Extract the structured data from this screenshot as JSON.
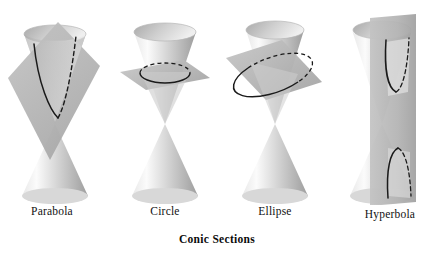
{
  "figure": {
    "title": "Conic Sections",
    "background_color": "#ffffff",
    "panels": [
      {
        "id": "parabola",
        "label": "Parabola",
        "icon": "double-cone-with-tilted-plane-icon",
        "description": "Double cone cut by a plane parallel to a generating line",
        "plane_orientation": "tilted steep",
        "curve": "open upward V-shaped parabola",
        "curve_solid_side": "left",
        "curve_dashed_side": "right"
      },
      {
        "id": "circle",
        "label": "Circle",
        "icon": "double-cone-with-horizontal-plane-icon",
        "description": "Double cone cut by a plane perpendicular to the axis",
        "plane_orientation": "horizontal",
        "curve": "closed ellipse shown in perspective as a circle",
        "curve_solid_side": "front",
        "curve_dashed_side": "back"
      },
      {
        "id": "ellipse",
        "label": "Ellipse",
        "icon": "double-cone-with-oblique-plane-icon",
        "description": "Double cone cut by an oblique plane crossing one nappe",
        "plane_orientation": "oblique",
        "curve": "closed tilted ellipse",
        "curve_solid_side": "front-left",
        "curve_dashed_side": "back-right"
      },
      {
        "id": "hyperbola",
        "label": "Hyperbola",
        "icon": "double-cone-with-vertical-plane-icon",
        "description": "Double cone cut by a vertical plane meeting both nappes",
        "plane_orientation": "vertical",
        "curve": "two opposite branches, one per nappe",
        "curve_solid_side": "left",
        "curve_dashed_side": "right"
      }
    ],
    "colors": {
      "cone_light": "#f2f2f2",
      "cone_mid": "#c9c9c9",
      "cone_dark": "#9a9a9a",
      "plane_fill": "#b4b4b4",
      "plane_fill_light": "#d6d6d6",
      "curve_stroke": "#1a1a1a",
      "text": "#111111"
    }
  }
}
